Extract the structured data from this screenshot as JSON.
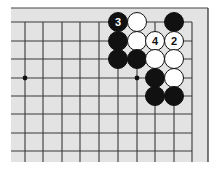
{
  "diagram": {
    "type": "go-board-fragment",
    "background_color": "#e3e3e3",
    "line_color": "#3a3a3a",
    "border_color": "#444444",
    "board_rect": {
      "left": 11,
      "top": 8,
      "right": 208,
      "bottom": 162
    },
    "columns_x": [
      25,
      43,
      62,
      80,
      99,
      118,
      137,
      155,
      174,
      192
    ],
    "rows_y": [
      22,
      41,
      59,
      78,
      96,
      114,
      133,
      151
    ],
    "grid_left": 11,
    "grid_right": 192,
    "grid_top": 22,
    "grid_bottom": 162,
    "top_border_y": 8,
    "right_border_x": 208,
    "star_points": [
      {
        "col": 0,
        "row": 3
      },
      {
        "col": 6,
        "row": 3
      }
    ],
    "stone_radius": 9.5,
    "stones": [
      {
        "color": "black",
        "col": 5,
        "row": 0,
        "label": "3"
      },
      {
        "color": "white",
        "col": 6,
        "row": 0,
        "label": ""
      },
      {
        "color": "black",
        "col": 8,
        "row": 0,
        "label": ""
      },
      {
        "color": "black",
        "col": 5,
        "row": 1,
        "label": ""
      },
      {
        "color": "white",
        "col": 6,
        "row": 1,
        "label": ""
      },
      {
        "color": "white",
        "col": 7,
        "row": 1,
        "label": "4"
      },
      {
        "color": "white",
        "col": 8,
        "row": 1,
        "label": "2"
      },
      {
        "color": "black",
        "col": 5,
        "row": 2,
        "label": ""
      },
      {
        "color": "black",
        "col": 6,
        "row": 2,
        "label": ""
      },
      {
        "color": "white",
        "col": 7,
        "row": 2,
        "label": ""
      },
      {
        "color": "white",
        "col": 8,
        "row": 2,
        "label": ""
      },
      {
        "color": "black",
        "col": 7,
        "row": 3,
        "label": ""
      },
      {
        "color": "white",
        "col": 8,
        "row": 3,
        "label": ""
      },
      {
        "color": "black",
        "col": 7,
        "row": 4,
        "label": ""
      },
      {
        "color": "black",
        "col": 8,
        "row": 4,
        "label": ""
      }
    ]
  }
}
